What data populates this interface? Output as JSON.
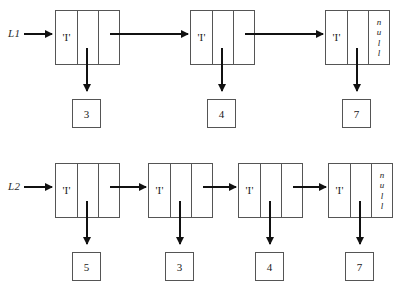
{
  "figure": {
    "type": "linked-list-diagram",
    "background_color": "#ffffff",
    "line_color": "#555555",
    "arrow_color": "#111111"
  },
  "lists": [
    {
      "name": "L1",
      "head_label": "L1",
      "nodes": [
        {
          "cell_char": "'I'",
          "value": "3",
          "next": "node",
          "null_text": [
            "n",
            "u",
            "l",
            "l"
          ]
        },
        {
          "cell_char": "'I'",
          "value": "4",
          "next": "node",
          "null_text": [
            "n",
            "u",
            "l",
            "l"
          ]
        },
        {
          "cell_char": "'I'",
          "value": "7",
          "next": "null",
          "null_text": [
            "n",
            "u",
            "l",
            "l"
          ]
        }
      ]
    },
    {
      "name": "L2",
      "head_label": "L2",
      "nodes": [
        {
          "cell_char": "'I'",
          "value": "5",
          "next": "node",
          "null_text": [
            "n",
            "u",
            "l",
            "l"
          ]
        },
        {
          "cell_char": "'I'",
          "value": "3",
          "next": "node",
          "null_text": [
            "n",
            "u",
            "l",
            "l"
          ]
        },
        {
          "cell_char": "'I'",
          "value": "4",
          "next": "node",
          "null_text": [
            "n",
            "u",
            "l",
            "l"
          ]
        },
        {
          "cell_char": "'I'",
          "value": "7",
          "next": "null",
          "null_text": [
            "n",
            "u",
            "l",
            "l"
          ]
        }
      ]
    }
  ]
}
